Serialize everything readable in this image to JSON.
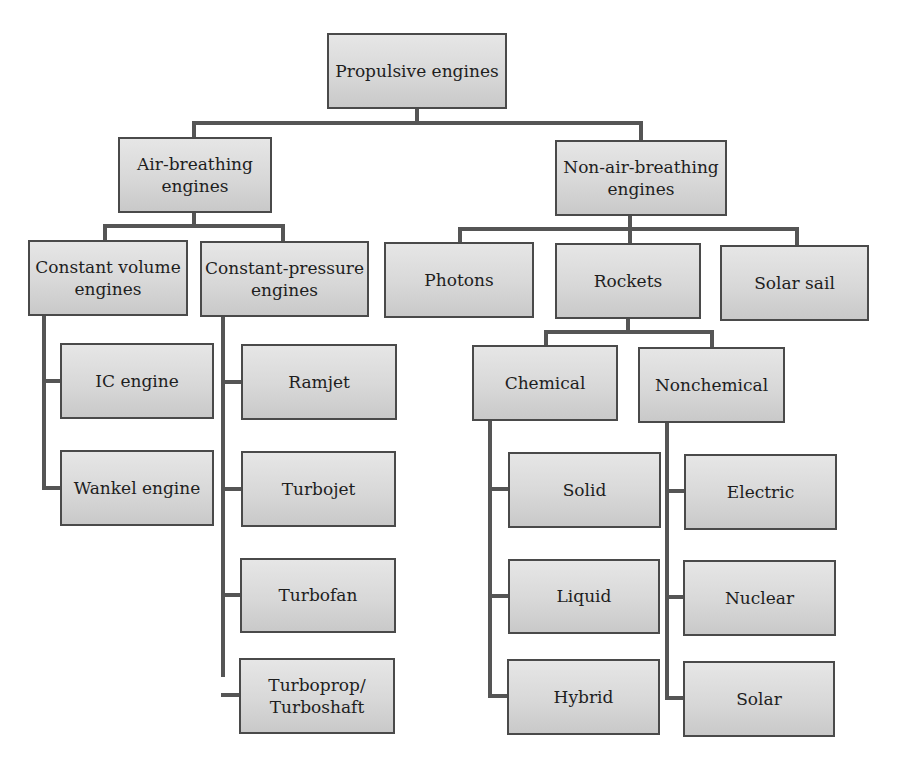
{
  "diagram": {
    "colors": {
      "box_fill": "#d8d8d8",
      "box_border": "#4a4a4a",
      "connector": "#555555",
      "text": "#1e1e1e"
    },
    "nodes": {
      "root": "Propulsive engines",
      "air_breathing": "Air-breathing\nengines",
      "non_air_breathing": "Non-air-breathing\nengines",
      "constant_volume": "Constant volume\nengines",
      "constant_pressure": "Constant-pressure\nengines",
      "photons": "Photons",
      "rockets": "Rockets",
      "solar_sail": "Solar sail",
      "ic_engine": "IC engine",
      "wankel_engine": "Wankel engine",
      "ramjet": "Ramjet",
      "turbojet": "Turbojet",
      "turbofan": "Turbofan",
      "turboprop": "Turboprop/\nTurboshaft",
      "chemical": "Chemical",
      "nonchemical": "Nonchemical",
      "solid": "Solid",
      "liquid": "Liquid",
      "hybrid": "Hybrid",
      "electric": "Electric",
      "nuclear": "Nuclear",
      "solar": "Solar"
    },
    "hierarchy": {
      "Propulsive engines": [
        "Air-breathing engines",
        "Non-air-breathing engines"
      ],
      "Air-breathing engines": [
        "Constant volume engines",
        "Constant-pressure engines"
      ],
      "Constant volume engines": [
        "IC engine",
        "Wankel engine"
      ],
      "Constant-pressure engines": [
        "Ramjet",
        "Turbojet",
        "Turbofan",
        "Turboprop/Turboshaft"
      ],
      "Non-air-breathing engines": [
        "Photons",
        "Rockets",
        "Solar sail"
      ],
      "Rockets": [
        "Chemical",
        "Nonchemical"
      ],
      "Chemical": [
        "Solid",
        "Liquid",
        "Hybrid"
      ],
      "Nonchemical": [
        "Electric",
        "Nuclear",
        "Solar"
      ]
    }
  }
}
